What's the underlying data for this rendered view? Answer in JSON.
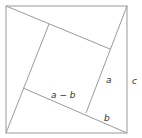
{
  "figure": {
    "line_color": "#9a9a9a",
    "label_color": "#333333",
    "outer_square": {
      "x1": 6,
      "y1": 6,
      "x2": 127,
      "y2": 133
    },
    "inner_square": [
      [
        49,
        24
      ],
      [
        110,
        49
      ],
      [
        86,
        113
      ],
      [
        23,
        88
      ]
    ],
    "labels": {
      "a": "a",
      "b": "b",
      "c": "c",
      "a_minus_b": "a − b"
    }
  }
}
